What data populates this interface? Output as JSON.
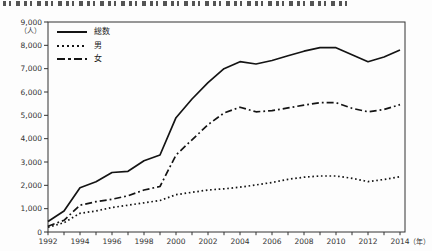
{
  "chart_data": {
    "type": "line",
    "x": [
      1992,
      1993,
      1994,
      1995,
      1996,
      1997,
      1998,
      1999,
      2000,
      2001,
      2002,
      2003,
      2004,
      2005,
      2006,
      2007,
      2008,
      2009,
      2010,
      2011,
      2012,
      2013,
      2014
    ],
    "series": [
      {
        "name": "総数",
        "style": "solid",
        "values": [
          450,
          900,
          1900,
          2150,
          2550,
          2600,
          3050,
          3300,
          4900,
          5700,
          6400,
          7000,
          7300,
          7200,
          7350,
          7550,
          7750,
          7900,
          7900,
          7600,
          7300,
          7500,
          7800
        ]
      },
      {
        "name": "男",
        "style": "dotted",
        "values": [
          200,
          400,
          800,
          900,
          1050,
          1150,
          1250,
          1350,
          1600,
          1700,
          1800,
          1850,
          1920,
          2020,
          2120,
          2260,
          2350,
          2400,
          2400,
          2300,
          2160,
          2250,
          2370
        ]
      },
      {
        "name": "女",
        "style": "dashdot",
        "values": [
          250,
          500,
          1150,
          1300,
          1400,
          1550,
          1800,
          1950,
          3300,
          3950,
          4600,
          5100,
          5350,
          5150,
          5200,
          5320,
          5440,
          5540,
          5540,
          5300,
          5150,
          5250,
          5460
        ]
      }
    ],
    "ylim": [
      0,
      9000
    ],
    "y_ticks": [
      "0",
      "1,000",
      "2,000",
      "3,000",
      "4,000",
      "5,000",
      "6,000",
      "7,000",
      "8,000",
      "9,000"
    ],
    "y_unit": "（人）",
    "x_tick_labels": [
      "1992",
      "1994",
      "1996",
      "1998",
      "2000",
      "2002",
      "2004",
      "2006",
      "2008",
      "2010",
      "2012",
      "2014"
    ],
    "x_unit": "（年）",
    "grid": false,
    "legend_position": "top-left",
    "line_color": "#141414",
    "axis_color": "#333333"
  }
}
